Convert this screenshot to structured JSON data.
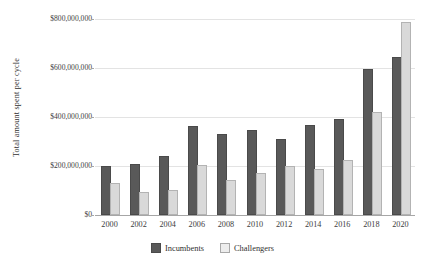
{
  "chart_data": {
    "type": "bar",
    "title": "",
    "xlabel": "",
    "ylabel": "Total amount spent per cycle",
    "categories": [
      "2000",
      "2002",
      "2004",
      "2006",
      "2008",
      "2010",
      "2012",
      "2014",
      "2016",
      "2018",
      "2020"
    ],
    "series": [
      {
        "name": "Incumbents",
        "color": "#595959",
        "values": [
          190000000,
          200000000,
          232000000,
          357000000,
          322000000,
          337000000,
          303000000,
          360000000,
          383000000,
          588000000,
          637000000
        ]
      },
      {
        "name": "Challengers",
        "color": "#d9d9d9",
        "values": [
          122000000,
          85000000,
          95000000,
          195000000,
          133000000,
          163000000,
          190000000,
          180000000,
          215000000,
          413000000,
          778000000
        ]
      }
    ],
    "ylim": [
      0,
      800000000
    ],
    "ytick_values": [
      0,
      200000000,
      400000000,
      600000000,
      800000000
    ],
    "ytick_labels": [
      "$0",
      "$200,000,000",
      "$400,000,000",
      "$600,000,000",
      "$800,000,000"
    ],
    "grid": true,
    "legend_position": "bottom",
    "legend_entries": [
      "Incumbents",
      "Challengers"
    ]
  }
}
